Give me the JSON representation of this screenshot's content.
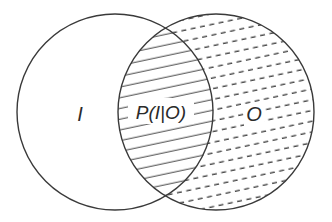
{
  "diagram": {
    "type": "venn",
    "sets": [
      {
        "id": "I",
        "label": "I",
        "cx": 115,
        "cy": 112,
        "r": 98,
        "fill_style": "none"
      },
      {
        "id": "O",
        "label": "O",
        "cx": 216,
        "cy": 112,
        "r": 98,
        "fill_style": "dashed-hatch"
      }
    ],
    "intersection": {
      "label": "P(I|O)",
      "fill_style": "solid-hatch"
    },
    "colors": {
      "stroke": "#3a3a3a",
      "hatch": "#3a3a3a",
      "background": "#ffffff"
    }
  },
  "labels": {
    "left_set": "I",
    "right_set": "O",
    "intersection": "P(I|O)"
  }
}
